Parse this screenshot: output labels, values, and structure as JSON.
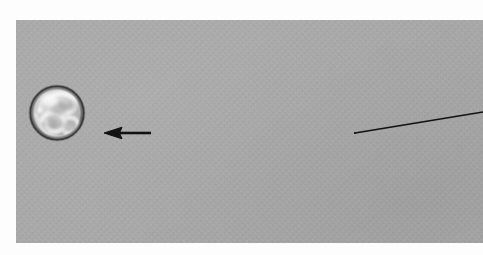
{
  "figure": {
    "kind": "grayscale-micrograph-panel",
    "panel": {
      "background_color": "#a9a9a9",
      "x": 16,
      "y": 20,
      "width": 467,
      "height": 223
    },
    "page_background_color": "#ffffff",
    "ink_color": "#111111"
  },
  "annotations": {
    "sphere": {
      "name": "spherical-particle",
      "center_x": 57,
      "center_y": 113,
      "diameter": 58,
      "rim_color": "#3c3c3c",
      "highlight_color": "#f2f2f2",
      "fill_color": "#b8b8b8",
      "caption": ""
    },
    "arrow": {
      "name": "pointer-arrow",
      "direction": "left",
      "tip_x": 105,
      "tip_y": 133,
      "tail_x": 150,
      "tail_y": 133,
      "color": "#111111",
      "label": ""
    },
    "leader_line": {
      "name": "leader-line",
      "start_x": 355,
      "start_y": 133,
      "end_x": 483,
      "end_y": 112,
      "color": "#111111",
      "label": ""
    }
  },
  "text": {
    "title": "",
    "caption": "",
    "scale_bar": "",
    "labels": []
  }
}
